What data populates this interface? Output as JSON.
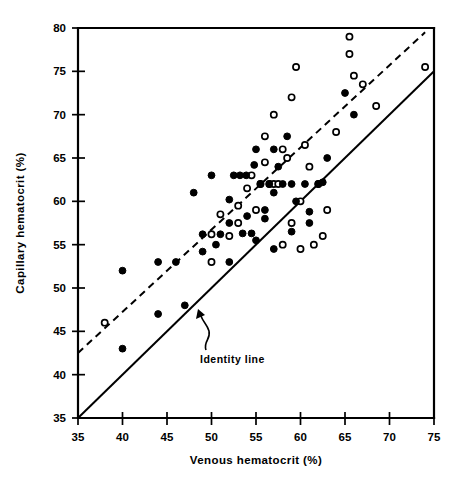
{
  "chart_data": {
    "type": "scatter",
    "title": "",
    "xlabel": "Venous hematocrit (%)",
    "ylabel": "Capillary hematocrit (%)",
    "xlim": [
      35,
      75
    ],
    "ylim": [
      35,
      80
    ],
    "xticks": [
      35,
      40,
      45,
      50,
      55,
      60,
      65,
      70,
      75
    ],
    "yticks": [
      35,
      40,
      45,
      50,
      55,
      60,
      65,
      70,
      75,
      80
    ],
    "grid": false,
    "legend_position": "none",
    "annotations": [
      {
        "text": "Identity line",
        "x": 50.5,
        "y": 41.0,
        "points_to_x": 48.2,
        "points_to_y": 47.2
      }
    ],
    "reference_lines": [
      {
        "name": "identity-line",
        "style": "solid",
        "x": [
          35,
          75
        ],
        "y": [
          35,
          75
        ],
        "label": "Identity line"
      },
      {
        "name": "fit-line",
        "style": "dashed",
        "x": [
          35,
          74
        ],
        "y": [
          42.5,
          79.5
        ],
        "label": ""
      }
    ],
    "series": [
      {
        "name": "filled-circles",
        "marker": "filled-circle",
        "color": "#000000",
        "points": [
          [
            40.0,
            43.0
          ],
          [
            40.0,
            52.0
          ],
          [
            44.0,
            47.0
          ],
          [
            44.0,
            53.0
          ],
          [
            46.0,
            53.0
          ],
          [
            47.0,
            48.0
          ],
          [
            49.0,
            54.2
          ],
          [
            49.0,
            56.2
          ],
          [
            50.0,
            63.0
          ],
          [
            51.0,
            56.2
          ],
          [
            52.5,
            63.0
          ],
          [
            53.2,
            63.0
          ],
          [
            53.9,
            63.0
          ],
          [
            52.0,
            60.2
          ],
          [
            52.0,
            57.5
          ],
          [
            53.5,
            56.3
          ],
          [
            54.0,
            58.3
          ],
          [
            54.5,
            56.3
          ],
          [
            54.8,
            64.2
          ],
          [
            55.0,
            66.0
          ],
          [
            55.5,
            62.0
          ],
          [
            56.5,
            62.0
          ],
          [
            56.0,
            59.0
          ],
          [
            56.0,
            58.0
          ],
          [
            57.0,
            66.0
          ],
          [
            57.5,
            64.0
          ],
          [
            57.0,
            61.0
          ],
          [
            58.0,
            62.0
          ],
          [
            58.5,
            67.5
          ],
          [
            59.0,
            62.0
          ],
          [
            59.5,
            60.0
          ],
          [
            60.5,
            62.0
          ],
          [
            61.0,
            58.8
          ],
          [
            61.0,
            57.5
          ],
          [
            62.0,
            62.0
          ],
          [
            62.5,
            62.2
          ],
          [
            63.0,
            65.0
          ],
          [
            65.0,
            72.5
          ],
          [
            66.0,
            70.0
          ],
          [
            48.0,
            61.0
          ],
          [
            50.5,
            55.0
          ],
          [
            55.0,
            55.5
          ],
          [
            57.0,
            54.5
          ],
          [
            59.0,
            56.5
          ],
          [
            52.0,
            53.0
          ]
        ]
      },
      {
        "name": "open-circles",
        "marker": "open-circle",
        "color": "#ffffff",
        "points": [
          [
            38.0,
            46.0
          ],
          [
            50.0,
            53.0
          ],
          [
            50.0,
            56.2
          ],
          [
            53.0,
            57.5
          ],
          [
            54.0,
            61.5
          ],
          [
            54.5,
            63.0
          ],
          [
            55.0,
            59.0
          ],
          [
            55.5,
            62.0
          ],
          [
            56.0,
            64.5
          ],
          [
            56.5,
            62.0
          ],
          [
            57.0,
            62.0
          ],
          [
            57.5,
            62.0
          ],
          [
            56.0,
            67.5
          ],
          [
            57.0,
            70.0
          ],
          [
            58.0,
            66.0
          ],
          [
            58.5,
            65.0
          ],
          [
            59.0,
            72.0
          ],
          [
            59.5,
            75.5
          ],
          [
            59.0,
            57.5
          ],
          [
            60.0,
            60.0
          ],
          [
            60.5,
            66.5
          ],
          [
            61.0,
            64.0
          ],
          [
            62.0,
            62.0
          ],
          [
            62.5,
            56.0
          ],
          [
            63.0,
            59.0
          ],
          [
            64.0,
            68.0
          ],
          [
            65.5,
            77.0
          ],
          [
            65.5,
            79.0
          ],
          [
            66.0,
            74.5
          ],
          [
            67.0,
            73.5
          ],
          [
            68.5,
            71.0
          ],
          [
            74.0,
            75.5
          ],
          [
            60.0,
            54.5
          ],
          [
            61.5,
            55.0
          ],
          [
            58.0,
            55.0
          ],
          [
            52.0,
            56.0
          ],
          [
            51.0,
            58.5
          ],
          [
            53.0,
            59.5
          ]
        ]
      }
    ]
  },
  "axes": {
    "x_title": "Venous hematocrit (%)",
    "y_title": "Capillary hematocrit (%)",
    "x_tick_labels": [
      "35",
      "40",
      "45",
      "50",
      "55",
      "60",
      "65",
      "70",
      "75"
    ],
    "y_tick_labels": [
      "35",
      "40",
      "45",
      "50",
      "55",
      "60",
      "65",
      "70",
      "75",
      "80"
    ]
  },
  "annotation": {
    "identity_label": "Identity line"
  },
  "colors": {
    "ink": "#000000",
    "background": "#ffffff",
    "marker_fill": "#000000",
    "marker_open_fill": "#ffffff"
  }
}
